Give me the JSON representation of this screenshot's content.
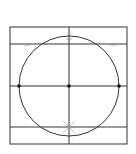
{
  "diagram": {
    "title": "",
    "type": "geometric-construction",
    "stroke_color": "#333333",
    "point_color": "#111111",
    "square": {
      "x": 10,
      "y": 27,
      "size": 117
    },
    "circle": {
      "cx": 69,
      "cy": 86,
      "r": 50
    },
    "horizontal_lines_y": [
      44,
      86,
      127
    ],
    "vertical_line_x": 69,
    "points": [
      {
        "x": 19,
        "y": 86
      },
      {
        "x": 69,
        "y": 86
      },
      {
        "x": 119,
        "y": 86
      }
    ]
  }
}
